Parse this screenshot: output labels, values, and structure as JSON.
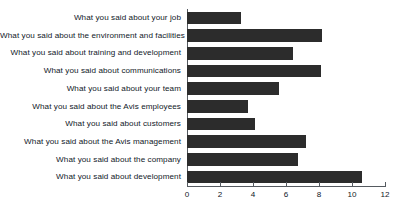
{
  "chart_data": {
    "type": "bar",
    "orientation": "horizontal",
    "title": "",
    "subtitle": "",
    "xlabel": "",
    "ylabel": "",
    "xlim": [
      0,
      12
    ],
    "xticks": [
      "0",
      "2",
      "4",
      "6",
      "8",
      "10",
      "12"
    ],
    "grid": false,
    "legend": null,
    "bar_color": "#2c2c2c",
    "axis_color": "#555a60",
    "background_color": "#ffffff",
    "categories": [
      "What you said about your job",
      "What you said about the environment and facilities",
      "What you said about training and development",
      "What you said about communications",
      "What you said about your team",
      "What you said about the Avis employees",
      "What you said about customers",
      "What you said about the Avis management",
      "What you said about the company",
      "What you said about development"
    ],
    "values": [
      3.3,
      8.2,
      6.4,
      8.1,
      5.6,
      3.7,
      4.1,
      7.2,
      6.7,
      10.6
    ]
  }
}
